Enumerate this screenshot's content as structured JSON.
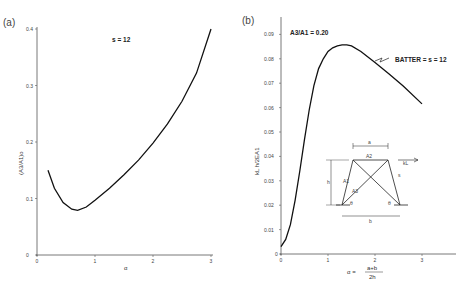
{
  "chart_data": [
    {
      "panel": "(a)",
      "type": "line",
      "title": "",
      "xlabel": "α",
      "ylabel": "(A3/A1)o",
      "annotation": "s = 12",
      "xlim": [
        0,
        3
      ],
      "ylim": [
        0,
        0.4
      ],
      "xticks": [
        "0",
        "1",
        "2",
        "3"
      ],
      "yticks": [
        "0",
        "0.1",
        "0.2",
        "0.3",
        "0.4"
      ],
      "grid": false,
      "series": [
        {
          "name": "s = 12",
          "x": [
            0.19,
            0.3,
            0.45,
            0.6,
            0.7,
            0.85,
            1.0,
            1.25,
            1.5,
            1.75,
            2.0,
            2.25,
            2.5,
            2.75,
            3.0
          ],
          "y": [
            0.15,
            0.118,
            0.093,
            0.081,
            0.079,
            0.085,
            0.097,
            0.118,
            0.142,
            0.168,
            0.198,
            0.232,
            0.272,
            0.322,
            0.4
          ]
        }
      ]
    },
    {
      "panel": "(b)",
      "type": "line",
      "title": "",
      "xlabel": "α = (a+b)/2h",
      "ylabel": "kL h/2EA1",
      "annotation": "A3/A1 = 0.20",
      "series_label": "BATTER = s = 12",
      "xlim": [
        0,
        3.7
      ],
      "ylim": [
        0,
        0.095
      ],
      "xticks": [
        "0",
        "1",
        "2",
        "3"
      ],
      "yticks": [
        "0",
        "0.01",
        "0.02",
        "0.03",
        "0.04",
        "0.05",
        "0.06",
        "0.07",
        "0.08",
        "0.09"
      ],
      "grid": false,
      "series": [
        {
          "name": "BATTER = s = 12",
          "x": [
            0.0,
            0.1,
            0.2,
            0.3,
            0.4,
            0.5,
            0.6,
            0.7,
            0.8,
            0.9,
            1.0,
            1.1,
            1.2,
            1.3,
            1.4,
            1.5,
            1.7,
            2.0,
            2.3,
            2.6,
            3.0
          ],
          "y": [
            0.003,
            0.006,
            0.012,
            0.022,
            0.034,
            0.047,
            0.059,
            0.069,
            0.076,
            0.08,
            0.083,
            0.0845,
            0.0853,
            0.0857,
            0.0857,
            0.0853,
            0.083,
            0.0785,
            0.0738,
            0.0688,
            0.0615
          ]
        }
      ],
      "inset_diagram": {
        "labels": [
          "a",
          "A2",
          "kL",
          "s",
          "h",
          "A1",
          "A3",
          "θ",
          "θ",
          "b"
        ]
      }
    }
  ],
  "panels": {
    "a": {
      "label": "(a)",
      "annotation": "s = 12",
      "xlabel": "α",
      "ylabel": "(A3/A1)o"
    },
    "b": {
      "label": "(b)",
      "annotation": "A3/A1 = 0.20",
      "series_label": "BATTER = s = 12",
      "xlabel_prefix": "α =",
      "xlabel_num": "a+b",
      "xlabel_den": "2h",
      "ylabel": "kL h/2EA1"
    }
  }
}
